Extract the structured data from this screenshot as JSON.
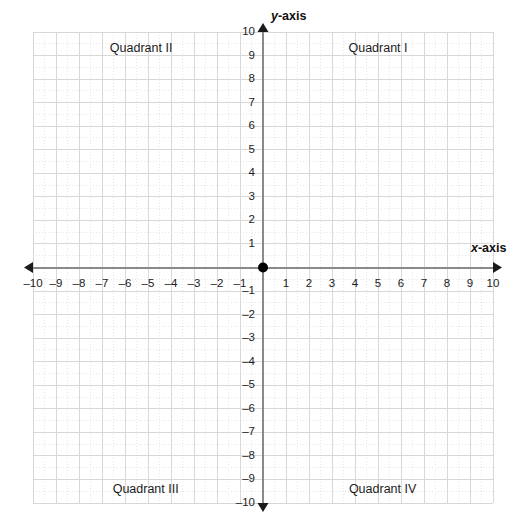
{
  "chart_data": {
    "type": "scatter",
    "title": "",
    "xlabel": "x-axis",
    "ylabel": "y-axis",
    "xlim": [
      -10,
      10
    ],
    "ylim": [
      -10,
      10
    ],
    "grid": true,
    "minor_grid": true,
    "minor_grid_step": 0.5,
    "major_grid_step": 1,
    "legend": "none",
    "series": [],
    "x_ticks": [
      -10,
      -9,
      -8,
      -7,
      -6,
      -5,
      -4,
      -3,
      -2,
      -1,
      1,
      2,
      3,
      4,
      5,
      6,
      7,
      8,
      9,
      10
    ],
    "y_ticks": [
      10,
      9,
      8,
      7,
      6,
      5,
      4,
      3,
      2,
      1,
      -1,
      -2,
      -3,
      -4,
      -5,
      -6,
      -7,
      -8,
      -9,
      -10
    ],
    "x_tick_labels": [
      "–10",
      "–9",
      "–8",
      "–7",
      "–6",
      "–5",
      "–4",
      "–3",
      "–2",
      "–1",
      "1",
      "2",
      "3",
      "4",
      "5",
      "6",
      "7",
      "8",
      "9",
      "10"
    ],
    "y_tick_labels": [
      "10",
      "9",
      "8",
      "7",
      "6",
      "5",
      "4",
      "3",
      "2",
      "1",
      "–1",
      "–2",
      "–3",
      "–4",
      "–5",
      "–6",
      "–7",
      "–8",
      "–9",
      "–10"
    ],
    "annotations": [
      {
        "text": "Quadrant I",
        "x": 5,
        "y": 9.3
      },
      {
        "text": "Quadrant II",
        "x": -5.3,
        "y": 9.3
      },
      {
        "text": "Quadrant III",
        "x": -5.1,
        "y": -9.4
      },
      {
        "text": "Quadrant IV",
        "x": 5.2,
        "y": -9.4
      }
    ],
    "origin_marker": {
      "x": 0,
      "y": 0,
      "style": "filled-circle"
    },
    "colors": {
      "axis": "#8a8a8a",
      "major_grid": "#d8d8d8",
      "minor_grid": "#e6e6e6",
      "text": "#1b1b1b",
      "origin": "#000000",
      "background": "#ffffff"
    }
  },
  "axes": {
    "x_label_var": "x",
    "x_label_suffix": "-axis",
    "y_label_var": "y",
    "y_label_suffix": "-axis"
  },
  "quadrants": {
    "q1": "Quadrant I",
    "q2": "Quadrant II",
    "q3": "Quadrant III",
    "q4": "Quadrant IV"
  }
}
